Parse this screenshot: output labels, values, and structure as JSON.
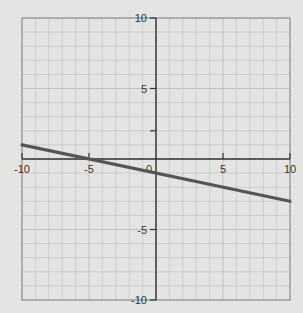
{
  "title_fragment": "y = -1/5 x - 1 (cropped)",
  "colors": {
    "background": "#e4e4e2",
    "grid": "#bdbdbb",
    "axis": "#333333",
    "line": "#555555"
  },
  "chart_data": {
    "type": "line",
    "title": "",
    "xlabel": "",
    "ylabel": "",
    "xlim": [
      -10,
      10
    ],
    "ylim": [
      -10,
      10
    ],
    "grid": true,
    "x_ticks": [
      -10,
      -5,
      0,
      5,
      10
    ],
    "y_ticks": [
      -10,
      -5,
      5,
      10
    ],
    "x_tick_labels": [
      "-10",
      "-5",
      "0",
      "5",
      "10"
    ],
    "y_tick_labels": [
      "-10",
      "-5",
      "5",
      "10"
    ],
    "series": [
      {
        "name": "y = -1/5 x - 1",
        "slope": -0.2,
        "intercept": -1,
        "x": [
          -10,
          -5,
          0,
          5,
          10
        ],
        "y": [
          1,
          0,
          -1,
          -2,
          -3
        ]
      }
    ]
  }
}
